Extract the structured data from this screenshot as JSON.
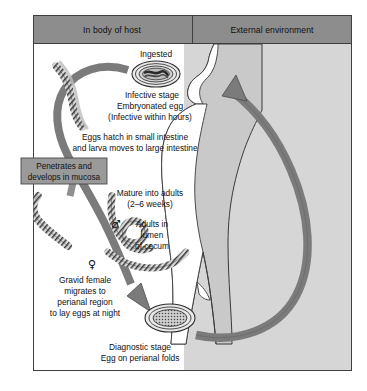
{
  "figure": {
    "outer_border_color": "#3c3c3c",
    "header_fill": "#8d8d8d",
    "body_fill": "#d4d4d4",
    "silhouette_fill": "#c9c9c9",
    "arrow_fill": "#7e7e7e",
    "label_box_fill": "#9a9a9a",
    "text_color": "#111111"
  },
  "header": {
    "left_label": "In body of host",
    "right_label": "External environment"
  },
  "labels": {
    "ingested": "Ingested",
    "infective_stage": "Infective stage",
    "embryonated_egg": "Embryonated egg",
    "infective_within_hours": "(Infective within hours)",
    "eggs_hatch_line1": "Eggs hatch in small intestine",
    "eggs_hatch_line2": "and larva moves to large intestine",
    "penetrates_line1": "Penetrates and",
    "penetrates_line2": "develops in mucosa",
    "mature_line1": "Mature into adults",
    "mature_line2": "(2–6 weeks)",
    "adults_line1": "Adults in",
    "adults_line2": "lumen",
    "adults_line3": "of cecum",
    "gravid_line1": "Gravid female",
    "gravid_line2": "migrates to",
    "gravid_line3": "perianal region",
    "gravid_line4": "to lay eggs at night",
    "diagnostic_line1": "Diagnostic stage",
    "diagnostic_line2": "Egg on perianal folds"
  },
  "symbols": {
    "male": "♂",
    "female": "♀"
  }
}
